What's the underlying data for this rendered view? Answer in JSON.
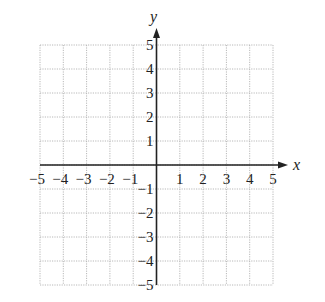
{
  "chart_data": {
    "type": "scatter",
    "title": "",
    "xlabel": "x",
    "ylabel": "y",
    "xlim": [
      -5,
      5
    ],
    "ylim": [
      -5,
      5
    ],
    "grid": true,
    "grid_style": "dotted",
    "x_ticks": [
      -5,
      -4,
      -3,
      -2,
      -1,
      1,
      2,
      3,
      4,
      5
    ],
    "y_ticks": [
      5,
      4,
      3,
      2,
      1,
      -1,
      -2,
      -3,
      -4,
      -5
    ],
    "x_tick_labels": [
      "−5",
      "−4",
      "−3",
      "−2",
      "−1",
      "1",
      "2",
      "3",
      "4",
      "5"
    ],
    "y_tick_labels": [
      "5",
      "4",
      "3",
      "2",
      "1",
      "−1",
      "−2",
      "−3",
      "−4",
      "−5"
    ],
    "series": [],
    "legend": null
  },
  "axes": {
    "x_label": "x",
    "y_label": "y"
  },
  "colors": {
    "axis": "#222222",
    "grid": "#b8b8b8",
    "background": "#ffffff"
  }
}
